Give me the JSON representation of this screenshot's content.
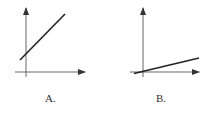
{
  "panels": [
    {
      "id": "A",
      "label": "A.",
      "description": "Straight line with positive slope and positive y-intercept",
      "axes": {
        "x_arrow": true,
        "y_arrow": true
      },
      "line": {
        "x1": 20,
        "y1": 60,
        "x2": 65,
        "y2": 14
      }
    },
    {
      "id": "B",
      "label": "B.",
      "description": "Straight line through origin with small positive slope",
      "axes": {
        "x_arrow": true,
        "y_arrow": true
      },
      "line": {
        "x1": 135,
        "y1": 73,
        "x2": 199,
        "y2": 58
      }
    }
  ],
  "colors": {
    "axis": "#555555",
    "line": "#222222",
    "label": "#333333"
  }
}
